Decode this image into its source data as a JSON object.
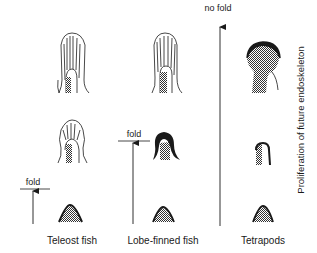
{
  "diagram": {
    "y_axis_label": "Proliferation of future endoskeleton",
    "columns": [
      {
        "name": "Teleost fish",
        "threshold_label": "fold",
        "stages": [
          "bud",
          "fin-fold-with-rays-small",
          "fin-fold-with-rays-large"
        ]
      },
      {
        "name": "Lobe-finned fish",
        "threshold_label": "fold",
        "stages": [
          "bud",
          "apical-ridge-thick",
          "fin-fold-with-rays-large"
        ]
      },
      {
        "name": "Tetrapods",
        "threshold_label": "no fold",
        "stages": [
          "bud",
          "apical-ridge",
          "paddle-with-ridge"
        ]
      }
    ],
    "colors": {
      "ink": "#1a1a1a",
      "stipple": "#8a8a8a",
      "background": "#ffffff"
    }
  }
}
